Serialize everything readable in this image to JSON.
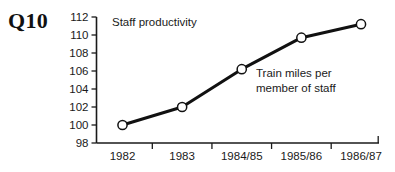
{
  "question_label": "Q10",
  "chart_data": {
    "type": "line",
    "title": "Staff productivity",
    "xlabel": "",
    "ylabel": "",
    "categories": [
      "1982",
      "1983",
      "1984/85",
      "1985/86",
      "1986/87"
    ],
    "values": [
      100,
      102,
      106.2,
      109.7,
      111.2
    ],
    "series": [
      {
        "name": "Train miles per member of staff",
        "values": [
          100,
          102,
          106.2,
          109.7,
          111.2
        ]
      }
    ],
    "ylim": [
      98,
      112
    ],
    "yticks": [
      98,
      100,
      102,
      104,
      106,
      108,
      110,
      112
    ],
    "ytick_labels": [
      "98",
      "100",
      "102",
      "104",
      "106",
      "108",
      "110",
      "112"
    ],
    "grid": false,
    "legend": "none",
    "annotations": [
      {
        "name": "series-annotation",
        "line1": "Train miles per",
        "line2": "member of staff"
      }
    ],
    "marker": "open-circle",
    "line_color": "#111111",
    "marker_fill": "#ffffff"
  }
}
